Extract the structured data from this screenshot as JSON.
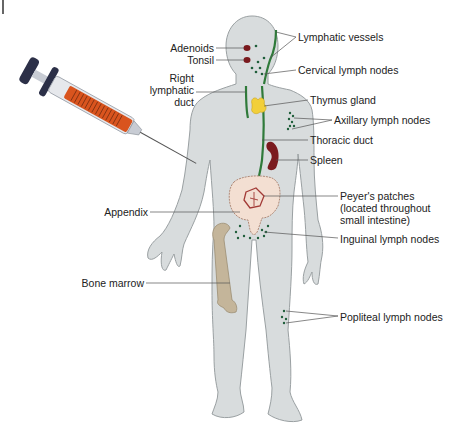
{
  "diagram": {
    "labels_left": [
      {
        "id": "adenoids",
        "text": "Adenoids"
      },
      {
        "id": "tonsil",
        "text": "Tonsil"
      },
      {
        "id": "right-lymphatic-duct",
        "text": "Right\nlymphatic\nduct"
      },
      {
        "id": "appendix",
        "text": "Appendix"
      },
      {
        "id": "bone-marrow",
        "text": "Bone marrow"
      }
    ],
    "labels_right": [
      {
        "id": "lymphatic-vessels",
        "text": "Lymphatic vessels"
      },
      {
        "id": "cervical-lymph-nodes",
        "text": "Cervical lymph nodes"
      },
      {
        "id": "thymus-gland",
        "text": "Thymus gland"
      },
      {
        "id": "axillary-lymph-nodes",
        "text": "Axillary lymph nodes"
      },
      {
        "id": "thoracic-duct",
        "text": "Thoracic duct"
      },
      {
        "id": "spleen",
        "text": "Spleen"
      },
      {
        "id": "peyers-patches",
        "text": "Peyer's patches\n(located throughout\nsmall intestine)"
      },
      {
        "id": "inguinal-lymph-nodes",
        "text": "Inguinal lymph nodes"
      },
      {
        "id": "popliteal-lymph-nodes",
        "text": "Popliteal lymph nodes"
      }
    ],
    "colors": {
      "body": "#d8dcdd",
      "body_outline": "#9aa0a2",
      "lymph": "#2f7a3a",
      "node": "#1f5e3a",
      "thymus": "#f2cf3a",
      "spleen": "#7a1a1e",
      "intestine": "#f3dfd2",
      "intestine_outline": "#b08a78",
      "bone": "#c4b59a",
      "syringe_fluid": "#d9541e",
      "syringe_cap": "#2c3048"
    }
  }
}
